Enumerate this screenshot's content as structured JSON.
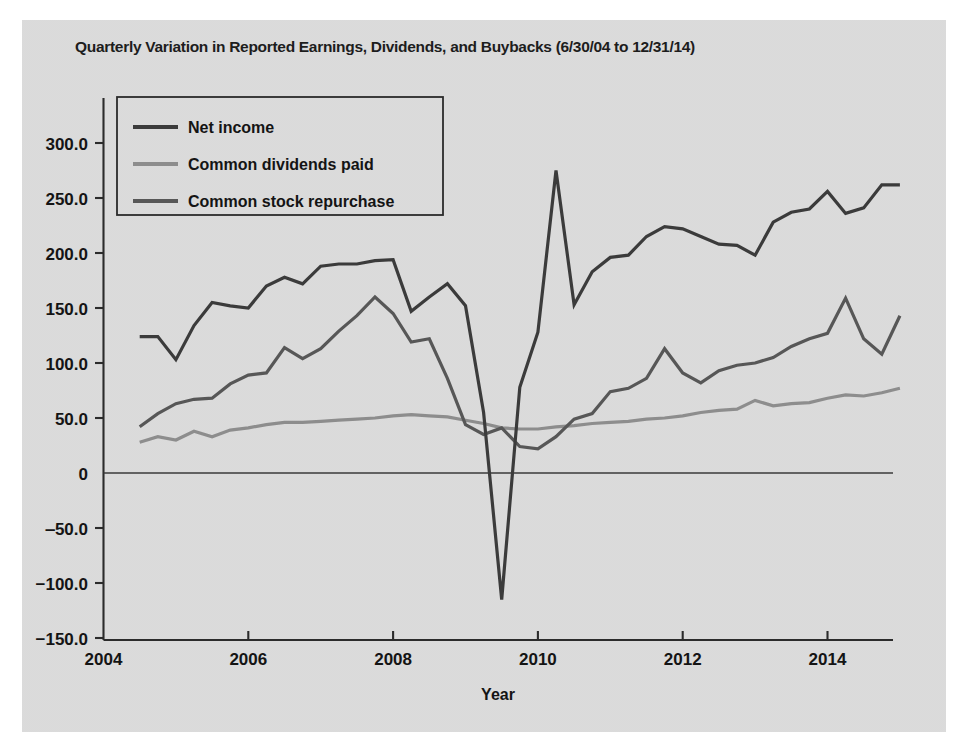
{
  "figure": {
    "title": "Quarterly Variation in Reported Earnings, Dividends, and Buybacks (6/30/04 to 12/31/14)",
    "xlabel": "Year",
    "ylabel": ""
  },
  "legend": {
    "items": [
      {
        "label": "Net income",
        "color": "#3b3b3b"
      },
      {
        "label": "Common dividends paid",
        "color": "#8d8d8d"
      },
      {
        "label": "Common stock repurchase",
        "color": "#575757"
      }
    ]
  },
  "axes": {
    "y_ticks": [
      "300.0",
      "250.0",
      "200.0",
      "150.0",
      "100.0",
      "50.0",
      "0",
      "‒50.0",
      "−100.0",
      "−150.0"
    ],
    "x_ticks": [
      "2004",
      "2006",
      "2008",
      "2010",
      "2012",
      "2014"
    ]
  },
  "chart_data": {
    "type": "line",
    "title": "Quarterly Variation in Reported Earnings, Dividends, and Buybacks (6/30/04 to 12/31/14)",
    "xlabel": "Year",
    "ylabel": "",
    "xlim": [
      2004.0,
      2015.1
    ],
    "ylim": [
      -150,
      325
    ],
    "ytick_values": [
      300,
      250,
      200,
      150,
      100,
      50,
      0,
      -50,
      -100,
      -150
    ],
    "ytick_labels": [
      "300.0",
      "250.0",
      "200.0",
      "150.0",
      "100.0",
      "50.0",
      "0",
      "-50.0",
      "-100.0",
      "-150.0"
    ],
    "xtick_values": [
      2004,
      2006,
      2008,
      2010,
      2012,
      2014
    ],
    "xtick_labels": [
      "2004",
      "2006",
      "2008",
      "2010",
      "2012",
      "2014"
    ],
    "grid": false,
    "legend_position": "upper left",
    "x": [
      2004.5,
      2004.75,
      2005.0,
      2005.25,
      2005.5,
      2005.75,
      2006.0,
      2006.25,
      2006.5,
      2006.75,
      2007.0,
      2007.25,
      2007.5,
      2007.75,
      2008.0,
      2008.25,
      2008.5,
      2008.75,
      2009.0,
      2009.25,
      2009.5,
      2009.75,
      2010.0,
      2010.25,
      2010.5,
      2010.75,
      2011.0,
      2011.25,
      2011.5,
      2011.75,
      2012.0,
      2012.25,
      2012.5,
      2012.75,
      2013.0,
      2013.25,
      2013.5,
      2013.75,
      2014.0,
      2014.25,
      2014.5,
      2014.75,
      2015.0
    ],
    "x_quarter_labels": [
      "6/30/04",
      "9/30/04",
      "12/31/04",
      "3/31/05",
      "6/30/05",
      "9/30/05",
      "12/31/05",
      "3/31/06",
      "6/30/06",
      "9/30/06",
      "12/31/06",
      "3/31/07",
      "6/30/07",
      "9/30/07",
      "12/31/07",
      "3/31/08",
      "6/30/08",
      "9/30/08",
      "12/31/08",
      "3/31/09",
      "6/30/09",
      "9/30/09",
      "12/31/09",
      "3/31/10",
      "6/30/10",
      "9/30/10",
      "12/31/10",
      "3/31/11",
      "6/30/11",
      "9/30/11",
      "12/31/11",
      "3/31/12",
      "6/30/12",
      "9/30/12",
      "12/31/12",
      "3/31/13",
      "6/30/13",
      "9/30/13",
      "12/31/13",
      "3/31/14",
      "6/30/14",
      "9/30/14",
      "12/31/14"
    ],
    "series": [
      {
        "name": "Net income",
        "color": "#3b3b3b",
        "values": [
          124,
          124,
          103,
          134,
          155,
          152,
          150,
          170,
          178,
          172,
          188,
          190,
          190,
          193,
          194,
          147,
          160,
          172,
          152,
          55,
          -115,
          78,
          128,
          275,
          153,
          183,
          196,
          198,
          215,
          224,
          222,
          215,
          208,
          207,
          198,
          228,
          237,
          240,
          256,
          236,
          241,
          262,
          262
        ]
      },
      {
        "name": "Common dividends paid",
        "color": "#8d8d8d",
        "values": [
          28,
          33,
          30,
          38,
          33,
          39,
          41,
          44,
          46,
          46,
          47,
          48,
          49,
          50,
          52,
          53,
          52,
          51,
          48,
          45,
          41,
          40,
          40,
          42,
          43,
          45,
          46,
          47,
          49,
          50,
          52,
          55,
          57,
          58,
          66,
          61,
          63,
          64,
          68,
          71,
          70,
          73,
          77
        ]
      },
      {
        "name": "Common stock repurchase",
        "color": "#575757",
        "values": [
          42,
          54,
          63,
          67,
          68,
          81,
          89,
          91,
          114,
          104,
          113,
          129,
          143,
          160,
          145,
          119,
          122,
          86,
          44,
          35,
          41,
          24,
          22,
          33,
          49,
          54,
          74,
          77,
          86,
          113,
          91,
          82,
          93,
          98,
          100,
          105,
          115,
          122,
          127,
          159,
          122,
          108,
          143
        ]
      }
    ]
  }
}
